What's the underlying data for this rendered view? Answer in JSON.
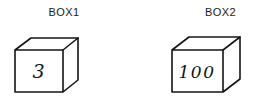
{
  "diagram": {
    "background_color": "#ffffff",
    "line_color": "#141414",
    "text_color": "#1b1b1b",
    "boxes": [
      {
        "label": "BOX1",
        "value": "3",
        "shape": "cube"
      },
      {
        "label": "BOX2",
        "value": "100",
        "shape": "cube"
      }
    ]
  }
}
